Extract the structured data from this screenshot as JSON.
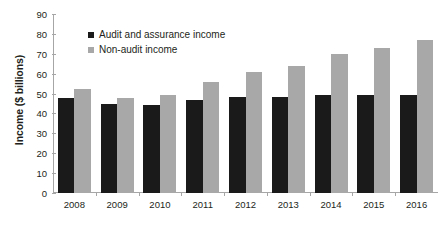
{
  "chart_data": {
    "type": "bar",
    "title": "",
    "xlabel": "",
    "ylabel": "Income ($ billions)",
    "categories": [
      "2008",
      "2009",
      "2010",
      "2011",
      "2012",
      "2013",
      "2014",
      "2015",
      "2016"
    ],
    "series": [
      {
        "name": "Audit and assurance income",
        "color": "#1a1a1a",
        "values": [
          48,
          45,
          44.5,
          47,
          48.5,
          48.5,
          49.5,
          49.5,
          49.5
        ]
      },
      {
        "name": "Non-audit income",
        "color": "#a8a8a8",
        "values": [
          52.5,
          48,
          49.5,
          56,
          61,
          64,
          70,
          73,
          77
        ]
      }
    ],
    "ylim": [
      0,
      90
    ],
    "yticks": [
      0,
      10,
      20,
      30,
      40,
      50,
      60,
      70,
      80,
      90
    ],
    "grid": false,
    "legend_position": "top-left"
  },
  "legend": {
    "items": [
      {
        "label": "Audit and assurance income",
        "swatch": "legend-swatch-black"
      },
      {
        "label": "Non-audit income",
        "swatch": "legend-swatch-gray"
      }
    ]
  },
  "axis": {
    "y_title": "Income ($ billions)"
  }
}
